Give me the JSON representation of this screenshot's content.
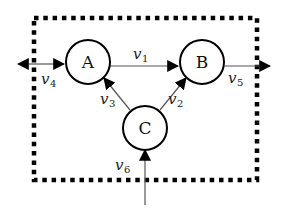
{
  "diagram": {
    "type": "flow-network",
    "boundary": {
      "style": "dotted",
      "color": "#000000"
    },
    "nodes": [
      {
        "id": "A",
        "label": "A"
      },
      {
        "id": "B",
        "label": "B"
      },
      {
        "id": "C",
        "label": "C"
      }
    ],
    "edges": [
      {
        "id": "v1",
        "var": "v",
        "sub": "1",
        "from": "A",
        "to": "B",
        "direction": "single"
      },
      {
        "id": "v2",
        "var": "v",
        "sub": "2",
        "from": "C",
        "to": "B",
        "direction": "single"
      },
      {
        "id": "v3",
        "var": "v",
        "sub": "3",
        "from": "C",
        "to": "A",
        "direction": "single"
      },
      {
        "id": "v4",
        "var": "v",
        "sub": "4",
        "from": "outside-left",
        "to": "A",
        "direction": "double"
      },
      {
        "id": "v5",
        "var": "v",
        "sub": "5",
        "from": "B",
        "to": "outside-right",
        "direction": "single"
      },
      {
        "id": "v6",
        "var": "v",
        "sub": "6",
        "from": "outside-bottom",
        "to": "C",
        "direction": "single"
      }
    ]
  }
}
